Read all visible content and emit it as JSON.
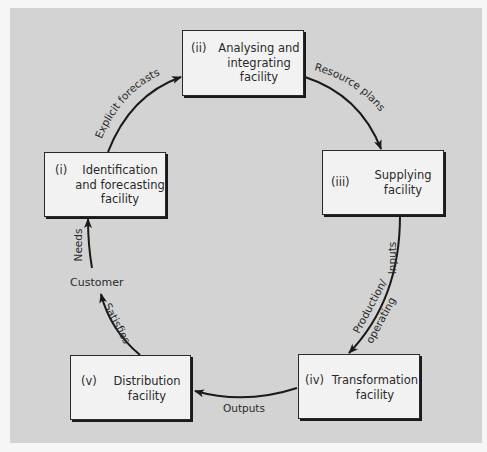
{
  "diagram": {
    "type": "cycle",
    "background_color": "#d3d3d3",
    "box_fill": "#f2f2f2",
    "stroke_color": "#1a1a1a",
    "nodes": [
      {
        "id": "i",
        "numeral": "(i)",
        "label": "Identification\nand forecasting\nfacility"
      },
      {
        "id": "ii",
        "numeral": "(ii)",
        "label": "Analysing and\nintegrating\nfacility"
      },
      {
        "id": "iii",
        "numeral": "(iii)",
        "label": "Supplying\nfacility"
      },
      {
        "id": "iv",
        "numeral": "(iv)",
        "label": "Transformation\nfacility"
      },
      {
        "id": "v",
        "numeral": "(v)",
        "label": "Distribution\nfacility"
      }
    ],
    "customer_label": "Customer",
    "edges": [
      {
        "from": "i",
        "to": "ii",
        "label": "Explicit forecasts"
      },
      {
        "from": "ii",
        "to": "iii",
        "label": "Resource plans"
      },
      {
        "from": "iii",
        "to": "iv",
        "label": "Inputs",
        "label2": "Production/",
        "label3": "operating"
      },
      {
        "from": "iv",
        "to": "v",
        "label": "Outputs"
      },
      {
        "from": "v",
        "to": "customer",
        "label": "Satisfies"
      },
      {
        "from": "customer",
        "to": "i",
        "label": "Needs"
      }
    ]
  }
}
